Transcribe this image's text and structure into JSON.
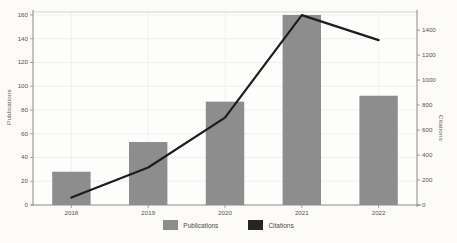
{
  "chart_data": {
    "type": "bar+line",
    "title": "",
    "categories": [
      "2018",
      "2019",
      "2020",
      "2021",
      "2022"
    ],
    "series": [
      {
        "name": "Publications",
        "type": "bar",
        "axis": "left",
        "color": "#8d8d8d",
        "values": [
          28,
          53,
          87,
          160,
          92
        ]
      },
      {
        "name": "Citations",
        "type": "line",
        "axis": "right",
        "color": "#1d1d1d",
        "values": [
          60,
          300,
          700,
          1520,
          1320
        ]
      }
    ],
    "left_axis": {
      "label": "Publications",
      "ticks": [
        0,
        20,
        40,
        60,
        80,
        100,
        120,
        140,
        160
      ],
      "range": [
        0,
        162.5
      ]
    },
    "right_axis": {
      "label": "Citations",
      "ticks": [
        0,
        200,
        400,
        600,
        800,
        1000,
        1200,
        1400
      ],
      "range": [
        0,
        1545
      ]
    },
    "x_axis": {
      "tick_labels": [
        "2018",
        "2019",
        "2020",
        "2021",
        "2022"
      ]
    },
    "legend": {
      "position": "bottom-center",
      "items": [
        {
          "label": "Publications",
          "color": "#8d8d8d"
        },
        {
          "label": "Citations",
          "color": "#262626"
        }
      ]
    },
    "grid": true,
    "style": {
      "plot_background": "#fdfdfc",
      "page_background": "#fcfbf8",
      "gridline_color": "#ececec",
      "spine_color": "#8a8a8a",
      "text_color": "#555555"
    }
  }
}
